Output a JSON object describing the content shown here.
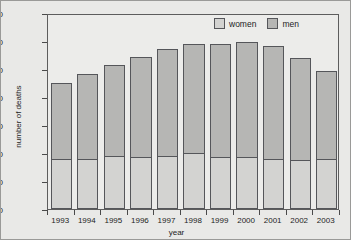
{
  "chart_data": {
    "type": "bar",
    "subtype": "stacked-vertical",
    "title": "",
    "xlabel": "year",
    "ylabel": "number of deaths",
    "categories": [
      "1993",
      "1994",
      "1995",
      "1996",
      "1997",
      "1998",
      "1999",
      "2000",
      "2001",
      "2002",
      "2003"
    ],
    "series": [
      {
        "name": "women",
        "color": "#d3d3d1",
        "values": [
          890,
          895,
          945,
          930,
          940,
          1000,
          935,
          935,
          900,
          880,
          885
        ]
      },
      {
        "name": "men",
        "color": "#b6b6b4",
        "values": [
          1355,
          1515,
          1625,
          1790,
          1925,
          1940,
          2015,
          2055,
          2010,
          1825,
          1580
        ]
      }
    ],
    "totals": [
      2245,
      2410,
      2570,
      2720,
      2865,
      2940,
      2950,
      2990,
      2910,
      2705,
      2465
    ],
    "ylim": [
      0,
      3500
    ],
    "yticks": [
      0,
      500,
      1000,
      1500,
      2000,
      2500,
      3000,
      3500
    ],
    "ytick_labels": [
      "0",
      "500",
      "1000",
      "1500",
      "2000",
      "2500",
      "3000",
      "3500"
    ],
    "grid": true,
    "legend_position": "top-right",
    "legend_entries": [
      "women",
      "men"
    ]
  },
  "legend": {
    "items": [
      {
        "label": "women",
        "swatch_name": "legend-swatch-women"
      },
      {
        "label": "men",
        "swatch_name": "legend-swatch-men"
      }
    ]
  },
  "colors": {
    "figure_background": "#e9e9e7",
    "plot_background": "#ececea",
    "bar_outline": "#55565a",
    "women_fill": "#d3d3d1",
    "men_fill": "#b6b6b4",
    "axis": "#4a4a4a",
    "grid": "#d8d8d6",
    "text": "#1d1d1d"
  }
}
